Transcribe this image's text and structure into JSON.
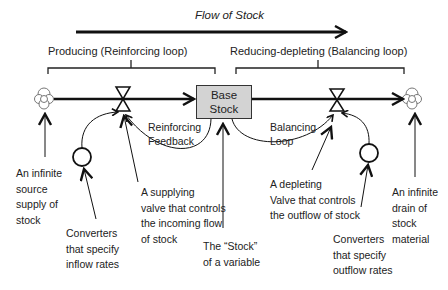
{
  "diagram": {
    "title": "Flow of Stock",
    "left_bracket_label": "Producing  (Reinforcing loop)",
    "right_bracket_label": "Reducing-depleting (Balancing loop)",
    "stock": {
      "line1": "Base",
      "line2": "Stock"
    },
    "loops": {
      "reinforcing": "Reinforcing\nFeedback",
      "balancing": "Balancing\nLoop"
    },
    "annotations": {
      "source": "An infinite\nsource\nsupply of\nstock",
      "inflow_converter": "Converters\nthat  specify\ninflow rates",
      "supply_valve": "A supplying\nvalve that controls\nthe incoming flow\n of stock",
      "stock_variable": "The “Stock”\nof a variable",
      "deplete_valve": "A depleting\nValve that controls\nthe outflow of stock",
      "outflow_converter": "Converters\nthat  specify\noutflow rates",
      "drain": "An infinite\ndrain of\nstock\nmaterial"
    },
    "colors": {
      "stock_fill": "#d3d3d3",
      "line": "#111111"
    }
  }
}
